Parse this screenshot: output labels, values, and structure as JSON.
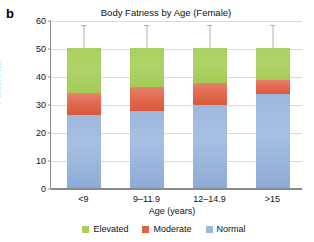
{
  "panel": {
    "letter": "b"
  },
  "chart_data": {
    "type": "bar",
    "subtype": "stacked-bar",
    "title": "Body Fatness by Age (Female)",
    "xlabel": "Age (years)",
    "ylabel": "Percent fat",
    "categories": [
      "<9",
      "9–11.9",
      "12–14.9",
      ">15"
    ],
    "ylim": [
      0,
      60
    ],
    "yticks": [
      0,
      10,
      20,
      30,
      40,
      50,
      60
    ],
    "ytick_labels": [
      "0",
      "10",
      "20",
      "30",
      "40",
      "50",
      "60"
    ],
    "grid": true,
    "legend_position": "bottom",
    "stack_order_bottom_to_top": [
      "Normal",
      "Moderate",
      "Elevated"
    ],
    "series": [
      {
        "name": "Normal",
        "color": "#9db8dd",
        "values": [
          26.0,
          27.5,
          29.5,
          33.5
        ]
      },
      {
        "name": "Moderate",
        "color": "#de6347",
        "values": [
          8.0,
          8.5,
          8.0,
          5.0
        ]
      },
      {
        "name": "Elevated",
        "color": "#a9d05f",
        "values": [
          16.0,
          14.0,
          12.5,
          11.5
        ]
      }
    ],
    "totals": [
      50,
      50,
      50,
      50
    ],
    "cumulative_tops": {
      "normal": [
        26.0,
        27.5,
        29.5,
        33.5
      ],
      "moderate": [
        34.0,
        36.0,
        37.5,
        38.5
      ],
      "elevated": [
        50.0,
        50.0,
        50.0,
        50.0
      ]
    },
    "error_bars": {
      "present": true,
      "upper_cap_value": [
        58.5,
        58.5,
        58.5,
        58.5
      ]
    },
    "legend": [
      {
        "label": "Elevated",
        "color": "#a9d05f"
      },
      {
        "label": "Moderate",
        "color": "#de6347"
      },
      {
        "label": "Normal",
        "color": "#9db8dd"
      }
    ]
  }
}
